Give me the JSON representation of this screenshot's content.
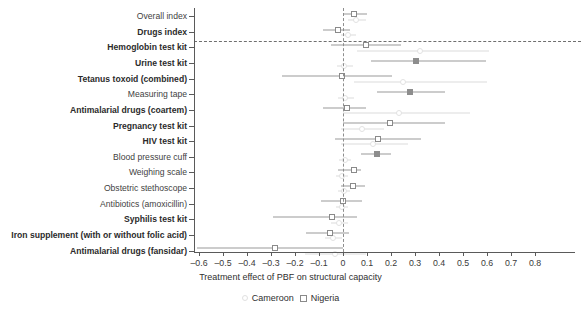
{
  "chart_data": {
    "type": "scatter",
    "subtype": "forest-plot",
    "title": "",
    "xlabel": "Treatment effect of PBF on structural capacity",
    "ylabel": "",
    "xlim": [
      -0.65,
      0.85
    ],
    "xticks": [
      -0.6,
      -0.5,
      -0.4,
      -0.3,
      -0.2,
      -0.1,
      0,
      0.1,
      0.2,
      0.3,
      0.4,
      0.5,
      0.6,
      0.7,
      0.8
    ],
    "xticklabels": [
      "–0.6",
      "–0.5",
      "–0.4",
      "–0.3",
      "–0.2",
      "–0.1",
      "0",
      "0.1",
      "0.2",
      "0.3",
      "0.4",
      "0.5",
      "0.6",
      "0.7",
      "0.8"
    ],
    "grid": false,
    "reference_line": 0,
    "separator_after_row": 2,
    "legend": {
      "position": "bottom-center",
      "entries": [
        {
          "name": "Cameroon",
          "marker": "circle-open",
          "color": "#e0e0e0"
        },
        {
          "name": "Nigeria",
          "marker": "square-open",
          "color": "#8a8a8a"
        }
      ]
    },
    "categories": [
      "Overall index",
      "Drugs index",
      "Hemoglobin test kit",
      "Urine test kit",
      "Tetanus toxoid (combined)",
      "Measuring tape",
      "Antimalarial drugs (coartem)",
      "Pregnancy test kit",
      "HIV test kit",
      "Blood pressure cuff",
      "Weighing scale",
      "Obstetric stethoscope",
      "Antibiotics (amoxicillin)",
      "Syphilis test kit",
      "Iron supplement (with or without folic acid)",
      "Antimalarial drugs (fansidar)"
    ],
    "bold_categories": [
      "Drugs index",
      "Hemoglobin test kit",
      "Urine test kit",
      "Tetanus toxoid (combined)",
      "Antimalarial drugs (coartem)",
      "Pregnancy test kit",
      "HIV test kit",
      "Syphilis test kit",
      "Iron supplement (with or without folic acid)",
      "Antimalarial drugs (fansidar)"
    ],
    "series": [
      {
        "name": "Nigeria",
        "marker": "square-open",
        "points": [
          {
            "category": "Overall index",
            "estimate": 0.045,
            "ci_low": 0.0,
            "ci_high": 0.1,
            "fill": false
          },
          {
            "category": "Drugs index",
            "estimate": -0.02,
            "ci_low": -0.085,
            "ci_high": 0.03,
            "fill": false
          },
          {
            "category": "Hemoglobin test kit",
            "estimate": 0.095,
            "ci_low": -0.05,
            "ci_high": 0.24,
            "fill": false
          },
          {
            "category": "Urine test kit",
            "estimate": 0.305,
            "ci_low": 0.115,
            "ci_high": 0.595,
            "fill": true
          },
          {
            "category": "Tetanus toxoid (combined)",
            "estimate": -0.005,
            "ci_low": -0.255,
            "ci_high": 0.205,
            "fill": false
          },
          {
            "category": "Measuring tape",
            "estimate": 0.28,
            "ci_low": 0.14,
            "ci_high": 0.425,
            "fill": true
          },
          {
            "category": "Antimalarial drugs (coartem)",
            "estimate": 0.015,
            "ci_low": -0.085,
            "ci_high": 0.095,
            "fill": false
          },
          {
            "category": "Pregnancy test kit",
            "estimate": 0.195,
            "ci_low": 0.0,
            "ci_high": 0.425,
            "fill": false
          },
          {
            "category": "HIV test kit",
            "estimate": 0.145,
            "ci_low": -0.035,
            "ci_high": 0.325,
            "fill": false
          },
          {
            "category": "Blood pressure cuff",
            "estimate": 0.14,
            "ci_low": 0.075,
            "ci_high": 0.2,
            "fill": true
          },
          {
            "category": "Weighing scale",
            "estimate": 0.045,
            "ci_low": -0.02,
            "ci_high": 0.075,
            "fill": false
          },
          {
            "category": "Obstetric stethoscope",
            "estimate": 0.04,
            "ci_low": -0.01,
            "ci_high": 0.09,
            "fill": false
          },
          {
            "category": "Antibiotics (amoxicillin)",
            "estimate": 0.0,
            "ci_low": -0.09,
            "ci_high": 0.08,
            "fill": false
          },
          {
            "category": "Syphilis test kit",
            "estimate": -0.045,
            "ci_low": -0.29,
            "ci_high": 0.06,
            "fill": false
          },
          {
            "category": "Iron supplement (with or without folic acid)",
            "estimate": -0.055,
            "ci_low": -0.155,
            "ci_high": 0.025,
            "fill": false
          },
          {
            "category": "Antimalarial drugs (fansidar)",
            "estimate": -0.285,
            "ci_low": -0.61,
            "ci_high": 0.0,
            "fill": false
          }
        ]
      },
      {
        "name": "Cameroon",
        "marker": "circle-open",
        "points": [
          {
            "category": "Overall index",
            "estimate": 0.055,
            "ci_low": 0.02,
            "ci_high": 0.095
          },
          {
            "category": "Drugs index",
            "estimate": 0.02,
            "ci_low": -0.01,
            "ci_high": 0.055
          },
          {
            "category": "Hemoglobin test kit",
            "estimate": 0.32,
            "ci_low": 0.06,
            "ci_high": 0.61
          },
          {
            "category": "Urine test kit",
            "estimate": 0.005,
            "ci_low": -0.025,
            "ci_high": 0.04
          },
          {
            "category": "Tetanus toxoid (combined)",
            "estimate": 0.25,
            "ci_low": 0.045,
            "ci_high": 0.6
          },
          {
            "category": "Measuring tape",
            "estimate": 0.01,
            "ci_low": -0.02,
            "ci_high": 0.045
          },
          {
            "category": "Antimalarial drugs (coartem)",
            "estimate": 0.235,
            "ci_low": 0.0,
            "ci_high": 0.53
          },
          {
            "category": "Pregnancy test kit",
            "estimate": 0.08,
            "ci_low": -0.01,
            "ci_high": 0.17
          },
          {
            "category": "HIV test kit",
            "estimate": 0.125,
            "ci_low": -0.01,
            "ci_high": 0.27
          },
          {
            "category": "Blood pressure cuff",
            "estimate": 0.01,
            "ci_low": -0.015,
            "ci_high": 0.035
          },
          {
            "category": "Weighing scale",
            "estimate": -0.005,
            "ci_low": -0.03,
            "ci_high": 0.02
          },
          {
            "category": "Obstetric stethoscope",
            "estimate": 0.005,
            "ci_low": -0.02,
            "ci_high": 0.03
          },
          {
            "category": "Antibiotics (amoxicillin)",
            "estimate": -0.005,
            "ci_low": -0.03,
            "ci_high": 0.02
          },
          {
            "category": "Syphilis test kit",
            "estimate": -0.015,
            "ci_low": -0.05,
            "ci_high": 0.02
          },
          {
            "category": "Iron supplement (with or without folic acid)",
            "estimate": -0.04,
            "ci_low": -0.075,
            "ci_high": -0.005
          },
          {
            "category": "Antimalarial drugs (fansidar)",
            "estimate": -0.035,
            "ci_low": -0.16,
            "ci_high": 0.095
          }
        ]
      }
    ]
  }
}
